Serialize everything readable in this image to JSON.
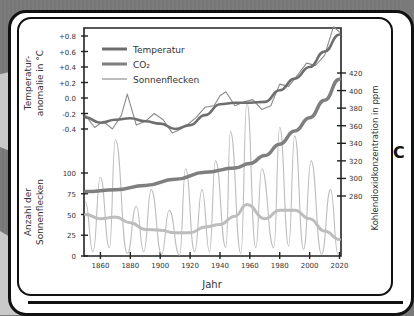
{
  "chart_data": {
    "type": "line",
    "title": "",
    "xlabel": "Jahr",
    "ylabel_left_top": "Temperaturanomalie in °C",
    "ylabel_left_top_lines": [
      "Temperatur-",
      "anomalie in °C"
    ],
    "ylabel_left_bottom": "Anzahl der Sonnenflecken",
    "ylabel_left_bottom_lines": [
      "Anzahl der",
      "Sonnenflecken"
    ],
    "ylabel_right": "Kohlendioxidkonzentration in ppm",
    "xlim": [
      1849,
      2021
    ],
    "x_ticks": [
      1860,
      1880,
      1900,
      1920,
      1940,
      1960,
      1980,
      2000,
      2020
    ],
    "y_temp_ticks": [
      "+0.8",
      "+0.6",
      "+0.4",
      "+0.2",
      "0.0",
      "-0.2",
      "-0.4"
    ],
    "y_temp_tick_values": [
      0.8,
      0.6,
      0.4,
      0.2,
      0.0,
      -0.2,
      -0.4
    ],
    "y_sunspot_ticks": [
      100,
      75,
      50,
      25,
      0
    ],
    "y_co2_ticks": [
      420,
      400,
      380,
      360,
      340,
      320,
      300,
      280
    ],
    "legend": [
      {
        "label": "Temperatur",
        "color": "#6e6e6e"
      },
      {
        "label": "CO₂",
        "color": "#7f7f7f"
      },
      {
        "label": "Sonnenflecken",
        "color": "#bdbdbd"
      }
    ],
    "legend_position": "upper-left",
    "grid": false,
    "series": [
      {
        "name": "Temperatur (geglättet)",
        "unit": "°C",
        "x": [
          1850,
          1860,
          1870,
          1880,
          1890,
          1900,
          1910,
          1920,
          1930,
          1940,
          1950,
          1960,
          1970,
          1980,
          1990,
          2000,
          2010,
          2020
        ],
        "values": [
          -0.25,
          -0.32,
          -0.28,
          -0.26,
          -0.3,
          -0.33,
          -0.4,
          -0.35,
          -0.22,
          -0.08,
          -0.06,
          -0.06,
          -0.05,
          0.1,
          0.25,
          0.4,
          0.6,
          0.82
        ]
      },
      {
        "name": "Temperatur (jährlich)",
        "unit": "°C",
        "x": [
          1850,
          1856,
          1862,
          1868,
          1874,
          1878,
          1884,
          1890,
          1896,
          1902,
          1908,
          1912,
          1918,
          1924,
          1930,
          1936,
          1940,
          1944,
          1950,
          1956,
          1962,
          1968,
          1974,
          1980,
          1986,
          1992,
          1998,
          2004,
          2010,
          2016,
          2020
        ],
        "values": [
          -0.22,
          -0.38,
          -0.3,
          -0.4,
          -0.22,
          0.05,
          -0.35,
          -0.3,
          -0.2,
          -0.28,
          -0.45,
          -0.42,
          -0.35,
          -0.25,
          -0.12,
          -0.1,
          0.03,
          0.08,
          -0.1,
          -0.05,
          -0.02,
          -0.15,
          -0.1,
          0.18,
          0.15,
          0.3,
          0.45,
          0.42,
          0.55,
          0.92,
          0.85
        ]
      },
      {
        "name": "CO₂",
        "unit": "ppm",
        "x": [
          1850,
          1870,
          1890,
          1910,
          1930,
          1950,
          1960,
          1970,
          1980,
          1990,
          2000,
          2010,
          2020
        ],
        "values": [
          285,
          287,
          292,
          299,
          307,
          312,
          317,
          326,
          339,
          354,
          369,
          389,
          413
        ]
      },
      {
        "name": "Sonnenflecken (geglättet)",
        "unit": "Anzahl",
        "x": [
          1850,
          1860,
          1870,
          1880,
          1890,
          1900,
          1910,
          1920,
          1930,
          1940,
          1950,
          1958,
          1970,
          1980,
          1990,
          2000,
          2010,
          2020
        ],
        "values": [
          50,
          45,
          47,
          40,
          32,
          31,
          28,
          28,
          35,
          38,
          48,
          62,
          45,
          55,
          55,
          45,
          30,
          20
        ]
      },
      {
        "name": "Sonnenflecken (jährlich)",
        "unit": "Anzahl",
        "x": [
          1850,
          1855,
          1860,
          1866,
          1870,
          1878,
          1884,
          1889,
          1894,
          1901,
          1906,
          1913,
          1917,
          1923,
          1928,
          1933,
          1937,
          1944,
          1947,
          1954,
          1958,
          1964,
          1968,
          1976,
          1980,
          1986,
          1990,
          1996,
          2001,
          2008,
          2014,
          2019
        ],
        "values": [
          65,
          5,
          95,
          10,
          140,
          3,
          60,
          5,
          80,
          2,
          55,
          1,
          105,
          5,
          80,
          5,
          115,
          10,
          150,
          3,
          185,
          10,
          105,
          10,
          155,
          12,
          145,
          8,
          115,
          2,
          80,
          2
        ]
      }
    ]
  }
}
